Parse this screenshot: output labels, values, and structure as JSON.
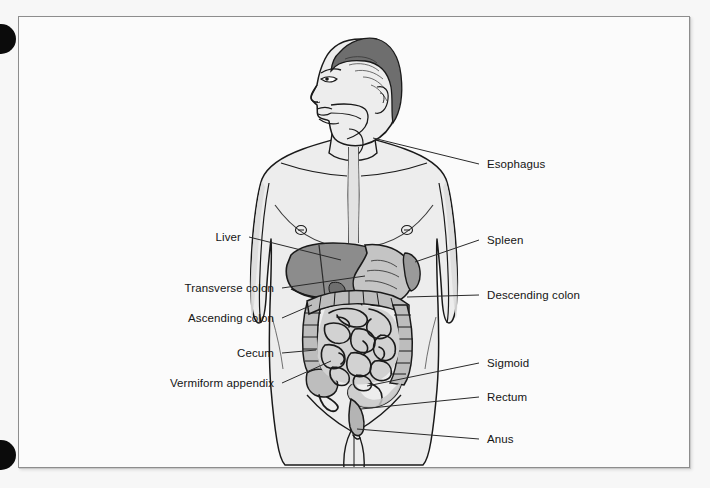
{
  "figure": {
    "frame": {
      "border_color": "#8d8d8d",
      "background": "#fbfbfb"
    }
  },
  "page": {
    "background": "#f7f7f7",
    "punch_holes": [
      {
        "name": "punch-hole-top",
        "color": "#0b0b0b"
      },
      {
        "name": "punch-hole-bottom",
        "color": "#0b0b0b"
      }
    ]
  },
  "colors": {
    "ink": "#1a1a1a",
    "body_fill": "#ededed",
    "body_shade": "#dcdcdc",
    "hair": "#6e6e6e",
    "liver": "#8c8c8c",
    "stomach": "#c4c4c4",
    "colon": "#bdbdbd",
    "small_intestine": "#d2d2d2",
    "label_text": "#151515",
    "leader_line": "#2a2a2a"
  },
  "labels": {
    "right": [
      {
        "id": "esophagus",
        "text": "Esophagus",
        "x": 486,
        "y": 159
      },
      {
        "id": "spleen",
        "text": "Spleen",
        "x": 486,
        "y": 235
      },
      {
        "id": "descending-colon",
        "text": "Descending colon",
        "x": 486,
        "y": 290
      },
      {
        "id": "sigmoid",
        "text": "Sigmoid",
        "x": 486,
        "y": 358
      },
      {
        "id": "rectum",
        "text": "Rectum",
        "x": 486,
        "y": 392
      },
      {
        "id": "anus",
        "text": "Anus",
        "x": 486,
        "y": 434
      }
    ],
    "left": [
      {
        "id": "liver",
        "text": "Liver",
        "x": 240,
        "y": 232
      },
      {
        "id": "transverse-colon",
        "text": "Transverse colon",
        "x": 272,
        "y": 283
      },
      {
        "id": "ascending-colon",
        "text": "Ascending colon",
        "x": 272,
        "y": 313
      },
      {
        "id": "cecum",
        "text": "Cecum",
        "x": 272,
        "y": 348
      },
      {
        "id": "vermiform-appendix",
        "text": "Vermiform appendix",
        "x": 272,
        "y": 378
      }
    ]
  },
  "leader_lines": {
    "esophagus": {
      "from": [
        478,
        163
      ],
      "to": [
        372,
        137
      ]
    },
    "spleen": {
      "from": [
        478,
        239
      ],
      "to": [
        401,
        249
      ]
    },
    "descending_colon": {
      "from": [
        478,
        294
      ],
      "to": [
        406,
        292
      ]
    },
    "sigmoid": {
      "from": [
        478,
        362
      ],
      "to": [
        366,
        381
      ]
    },
    "rectum": {
      "from": [
        478,
        396
      ],
      "to": [
        360,
        404
      ]
    },
    "anus": {
      "from": [
        478,
        438
      ],
      "to": [
        352,
        424
      ]
    },
    "liver": {
      "from": [
        248,
        236
      ],
      "to": [
        341,
        255
      ]
    },
    "transverse_colon": {
      "from": [
        281,
        287
      ],
      "to": [
        364,
        271
      ]
    },
    "ascending_colon": {
      "from": [
        281,
        317
      ],
      "to": [
        311,
        300
      ]
    },
    "cecum": {
      "from": [
        281,
        352
      ],
      "to": [
        315,
        345
      ]
    },
    "vermiform_appendix": {
      "from": [
        281,
        382
      ],
      "to": [
        330,
        356
      ]
    }
  }
}
